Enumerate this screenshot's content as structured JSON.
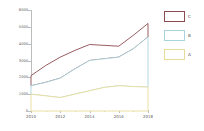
{
  "chart_data": {
    "type": "area",
    "stacked": true,
    "title": "",
    "subtitle": "",
    "xlabel": "",
    "ylabel": "",
    "x": [
      2010,
      2011,
      2012,
      2013,
      2014,
      2015,
      2016,
      2017,
      2018
    ],
    "categories": [
      "2010",
      "2011",
      "2012",
      "2013",
      "2014",
      "2015",
      "2016",
      "2017",
      "2018"
    ],
    "series": [
      {
        "name": "A",
        "color": "#e8dc9a",
        "fill": "#ffffff",
        "values": [
          1000,
          900,
          800,
          1000,
          1200,
          1400,
          1500,
          1450,
          1420
        ]
      },
      {
        "name": "B",
        "color": "#a9d4dd",
        "fill": "#ffffff",
        "values": [
          500,
          800,
          1150,
          1500,
          1800,
          1700,
          1700,
          2250,
          2980
        ]
      },
      {
        "name": "C",
        "color": "#8b4a4f",
        "fill": "#ffffff",
        "values": [
          600,
          1000,
          1250,
          1100,
          950,
          800,
          650,
          800,
          800
        ]
      }
    ],
    "cumulative_tops": {
      "A": [
        1000,
        900,
        800,
        1000,
        1200,
        1400,
        1500,
        1450,
        1420
      ],
      "A_plus_B": [
        1500,
        1700,
        1950,
        2500,
        3000,
        3100,
        3200,
        3700,
        4400
      ],
      "total": [
        2100,
        2700,
        3200,
        3600,
        3950,
        3900,
        3850,
        4500,
        5200
      ]
    },
    "xlim": [
      2010,
      2018
    ],
    "ylim": [
      0,
      6000
    ],
    "yticks": [
      0,
      1000,
      2000,
      3000,
      4000,
      5000,
      6000
    ],
    "ytick_labels": [
      "0",
      "1000",
      "2000",
      "3000",
      "4000",
      "5000",
      "6000"
    ],
    "xticks": [
      2010,
      2012,
      2014,
      2016,
      2018
    ],
    "xtick_labels": [
      "2010",
      "2012",
      "2014",
      "2016",
      "2018"
    ],
    "xticks_minor": [
      2011,
      2013,
      2015,
      2017
    ],
    "grid": false,
    "legend": {
      "position": "right",
      "entries": [
        {
          "label": "C",
          "color": "#8b4a4f"
        },
        {
          "label": "B",
          "color": "#a9d4dd"
        },
        {
          "label": "A",
          "color": "#e8dc9a"
        }
      ]
    },
    "background_color": "#ffffff",
    "axis_color": "#bdbdbd",
    "tick_label_color": "#5a5a5a"
  }
}
